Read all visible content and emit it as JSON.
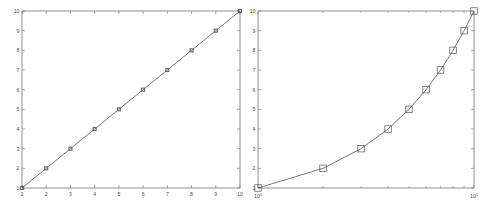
{
  "figure": {
    "background_color": "#ffffff",
    "axis_color": "#808080",
    "line_color": "#555555",
    "marker_edge_color": "#666666",
    "text_color": "#4a4a4a",
    "panel_count": 2
  },
  "chart_data": [
    {
      "type": "line",
      "name": "linear-plot",
      "title": "",
      "xlabel": "",
      "ylabel": "",
      "xscale": "linear",
      "yscale": "linear",
      "xlim": [
        1,
        10
      ],
      "ylim": [
        1,
        10
      ],
      "grid": false,
      "legend": null,
      "marker": "square",
      "x": [
        1,
        2,
        3,
        4,
        5,
        6,
        7,
        8,
        9,
        10
      ],
      "y": [
        1,
        2,
        3,
        4,
        5,
        6,
        7,
        8,
        9,
        10
      ],
      "xticks": [
        1,
        2,
        3,
        4,
        5,
        6,
        7,
        8,
        9,
        10
      ],
      "xticklabels": [
        "1",
        "2",
        "3",
        "4",
        "5",
        "6",
        "7",
        "8",
        "9",
        "10"
      ],
      "yticks": [
        1,
        2,
        3,
        4,
        5,
        6,
        7,
        8,
        9,
        10
      ],
      "yticklabels": [
        "1",
        "2",
        "3",
        "4",
        "5",
        "6",
        "7",
        "8",
        "9",
        "10"
      ]
    },
    {
      "type": "line",
      "name": "semilogx-plot",
      "title": "",
      "xlabel": "",
      "ylabel": "",
      "xscale": "log",
      "yscale": "linear",
      "xlim": [
        1,
        10
      ],
      "ylim": [
        1,
        10
      ],
      "grid": false,
      "legend": null,
      "marker": "square",
      "x": [
        1,
        2,
        3,
        4,
        5,
        6,
        7,
        8,
        9,
        10
      ],
      "y": [
        1,
        2,
        3,
        4,
        5,
        6,
        7,
        8,
        9,
        10
      ],
      "xticks": [
        1,
        10
      ],
      "xticklabels": [
        "10^0",
        "10^1"
      ],
      "xtick_mantissa": [
        "10",
        "10"
      ],
      "xtick_exponent": [
        "0",
        "1"
      ],
      "xminorticks": [
        2,
        3,
        4,
        5,
        6,
        7,
        8,
        9,
        20,
        30
      ],
      "yticks": [
        1,
        2,
        3,
        4,
        5,
        6,
        7,
        8,
        9,
        10
      ],
      "yticklabels": [
        "1",
        "2",
        "3",
        "4",
        "5",
        "6",
        "7",
        "8",
        "9",
        "10"
      ]
    }
  ]
}
